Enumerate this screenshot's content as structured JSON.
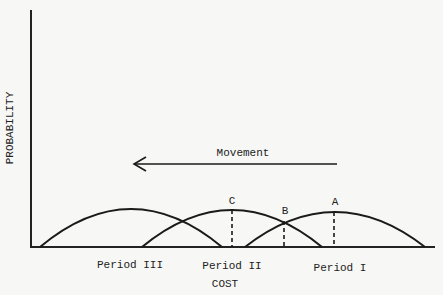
{
  "diagram": {
    "axes": {
      "y_label": "PROBABILITY",
      "x_label": "COST"
    },
    "arrow": {
      "label": "Movement",
      "direction": "left"
    },
    "curves": [
      {
        "id": "period-iii",
        "label": "Period III"
      },
      {
        "id": "period-ii",
        "label": "Period II"
      },
      {
        "id": "period-i",
        "label": "Period I"
      }
    ],
    "points": [
      {
        "id": "C",
        "label": "C"
      },
      {
        "id": "B",
        "label": "B"
      },
      {
        "id": "A",
        "label": "A"
      }
    ],
    "colors": {
      "line": "#1a1a1a",
      "background": "#f7f7f5"
    }
  }
}
